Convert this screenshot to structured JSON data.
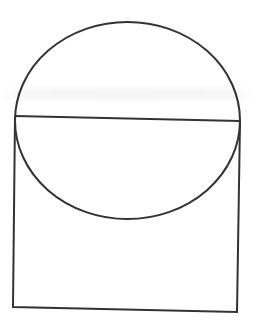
{
  "figure": {
    "stroke_color": "#333333",
    "background_color": "#ffffff",
    "stroke_width": 2,
    "ellipse": {
      "cx": 127.5,
      "cy": 120.5,
      "rx": 112.5,
      "ry": 98.5
    },
    "diameter": {
      "x1": 15,
      "y1": 116,
      "x2": 240,
      "y2": 121
    },
    "rectangle": {
      "points": [
        [
          15,
          116
        ],
        [
          13,
          307
        ],
        [
          237,
          312
        ],
        [
          240,
          121
        ]
      ]
    }
  }
}
